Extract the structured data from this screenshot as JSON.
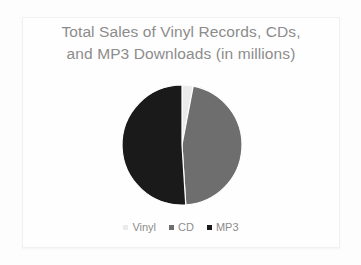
{
  "slide": {
    "background_color": "#fdfdfd",
    "frame_color": "#f1f1f1"
  },
  "chart_data": {
    "type": "pie",
    "title": "Total Sales of Vinyl Records, CDs, and MP3 Downloads (in millions)",
    "title_lines": [
      "Total Sales of Vinyl Records, CDs,",
      "and MP3 Downloads (in millions)"
    ],
    "title_color": "#8c8c8c",
    "xlabel": "",
    "ylabel": "",
    "grid": false,
    "legend_position": "bottom",
    "categories": [
      "Vinyl",
      "CD",
      "MP3"
    ],
    "values": [
      3,
      46,
      51
    ],
    "unit": "millions",
    "slices": [
      {
        "label": "Vinyl",
        "value": 3,
        "percent": 3,
        "color": "#ebebeb",
        "start_angle": 0,
        "end_angle": 10.8
      },
      {
        "label": "CD",
        "value": 46,
        "percent": 46,
        "color": "#6e6e6e",
        "start_angle": 10.8,
        "end_angle": 176.4
      },
      {
        "label": "MP3",
        "value": 51,
        "percent": 51,
        "color": "#1a1a1a",
        "start_angle": 176.4,
        "end_angle": 360
      }
    ],
    "legend": [
      {
        "label": "Vinyl",
        "color": "#ebebeb"
      },
      {
        "label": "CD",
        "color": "#6e6e6e"
      },
      {
        "label": "MP3",
        "color": "#1a1a1a"
      }
    ],
    "geometry": {
      "center_x": 70,
      "center_y": 70,
      "radius": 60
    }
  }
}
